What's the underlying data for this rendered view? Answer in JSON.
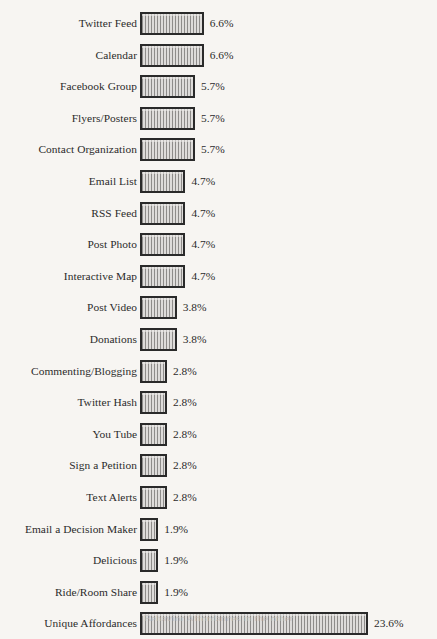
{
  "chart_data": {
    "type": "bar",
    "orientation": "horizontal",
    "title": "",
    "subtitle": "",
    "xlabel": "",
    "ylabel": "",
    "grid": false,
    "legend": null,
    "legend_position": "none",
    "value_suffix": "%",
    "xlim": [
      0,
      23.6
    ],
    "axis_ticks_visible": false,
    "categories": [
      "Twitter Feed",
      "Calendar",
      "Facebook Group",
      "Flyers/Posters",
      "Contact Organization",
      "Email List",
      "RSS Feed",
      "Post Photo",
      "Interactive Map",
      "Post Video",
      "Donations",
      "Commenting/Blogging",
      "Twitter Hash",
      "You Tube",
      "Sign a Petition",
      "Text Alerts",
      "Email a Decision Maker",
      "Delicious",
      "Ride/Room Share",
      "Unique Affordances"
    ],
    "values": [
      6.6,
      6.6,
      5.7,
      5.7,
      5.7,
      4.7,
      4.7,
      4.7,
      4.7,
      3.8,
      3.8,
      2.8,
      2.8,
      2.8,
      2.8,
      2.8,
      1.9,
      1.9,
      1.9,
      23.6
    ],
    "value_labels": [
      "6.6%",
      "6.6%",
      "5.7%",
      "5.7%",
      "5.7%",
      "4.7%",
      "4.7%",
      "4.7%",
      "4.7%",
      "3.8%",
      "3.8%",
      "2.8%",
      "2.8%",
      "2.8%",
      "2.8%",
      "2.8%",
      "1.9%",
      "1.9%",
      "1.9%",
      "23.6%"
    ],
    "colors": {
      "bar_fill": "#d2d0ce",
      "bar_hatch": "#8e8c8a",
      "bar_border": "#2a2a2a",
      "text": "#2b2b2b",
      "background": "#f7f5f2"
    }
  },
  "footer": {
    "cropped_caption": "Behavior                         Affordances in the other"
  }
}
